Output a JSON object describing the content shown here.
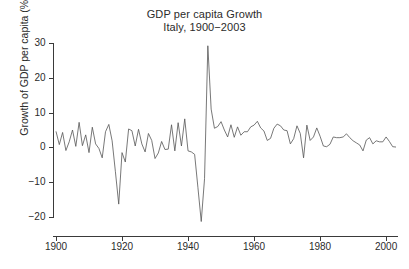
{
  "chart_data": {
    "type": "line",
    "title": "GDP per capita Growth",
    "subtitle": "Italy, 1900−2003",
    "xlabel": "",
    "ylabel": "Growth of GDP per capita (%)",
    "xlim": [
      1898,
      2004
    ],
    "ylim": [
      -22,
      31
    ],
    "grid": false,
    "legend": null,
    "xticks": [
      1900,
      1920,
      1940,
      1960,
      1980,
      2000
    ],
    "yticks": [
      -20,
      -10,
      0,
      10,
      20,
      30
    ],
    "line_color": "#555555",
    "series": [
      {
        "name": "Growth of GDP per capita",
        "x": [
          1900,
          1901,
          1902,
          1903,
          1904,
          1905,
          1906,
          1907,
          1908,
          1909,
          1910,
          1911,
          1912,
          1913,
          1914,
          1915,
          1916,
          1917,
          1918,
          1919,
          1920,
          1921,
          1922,
          1923,
          1924,
          1925,
          1926,
          1927,
          1928,
          1929,
          1930,
          1931,
          1932,
          1933,
          1934,
          1935,
          1936,
          1937,
          1938,
          1939,
          1940,
          1941,
          1942,
          1943,
          1944,
          1945,
          1946,
          1947,
          1948,
          1949,
          1950,
          1951,
          1952,
          1953,
          1954,
          1955,
          1956,
          1957,
          1958,
          1959,
          1960,
          1961,
          1962,
          1963,
          1964,
          1965,
          1966,
          1967,
          1968,
          1969,
          1970,
          1971,
          1972,
          1973,
          1974,
          1975,
          1976,
          1977,
          1978,
          1979,
          1980,
          1981,
          1982,
          1983,
          1984,
          1985,
          1986,
          1987,
          1988,
          1989,
          1990,
          1991,
          1992,
          1993,
          1994,
          1995,
          1996,
          1997,
          1998,
          1999,
          2000,
          2001,
          2002,
          2003
        ],
        "values": [
          4.6,
          0.8,
          4.3,
          -0.9,
          1.6,
          5.0,
          0.3,
          7.2,
          0.5,
          3.6,
          -1.5,
          5.8,
          1.0,
          -0.3,
          -3.0,
          4.5,
          6.6,
          1.9,
          -7.0,
          -16.3,
          -1.5,
          -4.2,
          5.3,
          4.8,
          0.4,
          5.2,
          1.0,
          -1.3,
          4.0,
          2.0,
          -3.2,
          -1.6,
          1.7,
          -0.6,
          -0.5,
          6.5,
          -1.0,
          7.1,
          0.4,
          8.2,
          -1.0,
          -1.3,
          -2.0,
          -11.6,
          -21.3,
          -9.0,
          29.2,
          11.0,
          5.5,
          6.0,
          7.4,
          5.0,
          3.0,
          6.5,
          2.9,
          5.9,
          3.5,
          4.5,
          4.5,
          5.9,
          6.4,
          7.5,
          5.6,
          4.7,
          2.0,
          2.6,
          5.5,
          6.7,
          6.2,
          5.0,
          4.8,
          1.0,
          2.5,
          6.2,
          4.0,
          -3.0,
          6.4,
          2.0,
          3.0,
          5.6,
          3.2,
          0.4,
          0.2,
          0.9,
          3.0,
          2.8,
          2.8,
          3.0,
          3.9,
          2.8,
          1.9,
          1.3,
          0.7,
          -1.0,
          2.1,
          2.8,
          1.0,
          1.9,
          1.6,
          1.6,
          3.0,
          1.7,
          0.2,
          0.1
        ]
      }
    ]
  },
  "axis": {
    "y_tick_labels": [
      "30",
      "20",
      "10",
      "0",
      "−10",
      "−20"
    ],
    "x_tick_labels": [
      "1900",
      "1920",
      "1940",
      "1960",
      "1980",
      "2000"
    ]
  }
}
